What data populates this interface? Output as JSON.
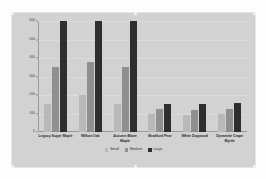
{
  "chart_data": {
    "type": "bar",
    "title": "",
    "xlabel": "",
    "ylabel": "",
    "ylim": [
      0,
      600
    ],
    "yticks": [
      0,
      100,
      200,
      300,
      400,
      500,
      600
    ],
    "ytick_labels": [
      "0",
      "100",
      "200",
      "300",
      "400",
      "500",
      "600"
    ],
    "grid": true,
    "legend_position": "bottom-center",
    "categories": [
      "Legacy Sugar Maple",
      "Willow Oak",
      "Autumn Blaze Maple",
      "Bradford Pear",
      "White Dogwood",
      "Dynamite Crape Myrtle"
    ],
    "series": [
      {
        "name": "Small",
        "color": "#b9b9b9",
        "values": [
          150,
          200,
          150,
          100,
          90,
          95
        ]
      },
      {
        "name": "Medium",
        "color": "#8f8f8f",
        "values": [
          350,
          380,
          350,
          125,
          120,
          125
        ]
      },
      {
        "name": "Large",
        "color": "#2e2e2e",
        "values": [
          600,
          600,
          600,
          150,
          150,
          155
        ]
      }
    ]
  }
}
